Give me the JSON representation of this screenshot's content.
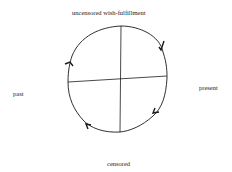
{
  "diagram": {
    "labels": {
      "top": "uncensored wish-fulfillment",
      "right": "present",
      "left": "past",
      "bottom": "censored"
    },
    "shape": "hand-drawn circle divided into four quadrants by crossing axes",
    "arrows": "four arrowheads indicating clockwise flow around the circle",
    "colors": {
      "line": "#1a1a1a",
      "background": "#ffffff"
    }
  }
}
